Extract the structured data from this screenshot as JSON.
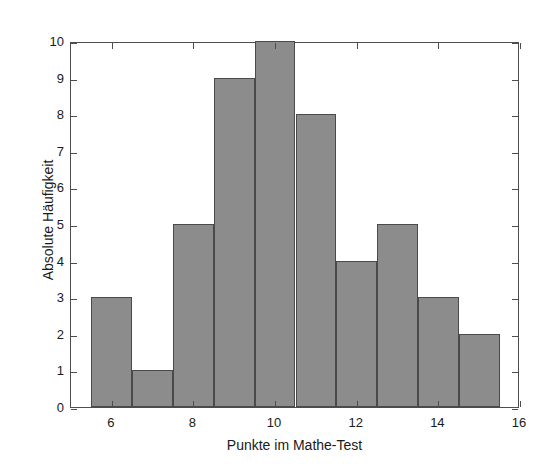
{
  "chart_data": {
    "type": "bar",
    "title": "",
    "subtitle": "",
    "xlabel": "Punkte im Mathe-Test",
    "ylabel": "Absolute Häufigkeit",
    "xlim": [
      5,
      16
    ],
    "ylim": [
      0,
      10
    ],
    "grid": false,
    "legend": null,
    "legend_position": "none",
    "bar_fill_color": "#8c8c8c",
    "bar_edge_color": "#4a4a4a",
    "axis_color": "#4d4d4d",
    "background_color": "#ffffff",
    "bin_width": 1,
    "categories": [
      6,
      7,
      8,
      9,
      10,
      11,
      12,
      13,
      14,
      15
    ],
    "bin_edges": [
      5.5,
      6.5,
      7.5,
      8.5,
      9.5,
      10.5,
      11.5,
      12.5,
      13.5,
      14.5,
      15.5
    ],
    "values": [
      3,
      1,
      5,
      9,
      10,
      8,
      4,
      5,
      3,
      2
    ],
    "bars": [
      {
        "center": 6,
        "left": 5.5,
        "right": 6.5,
        "value": 3
      },
      {
        "center": 7,
        "left": 6.5,
        "right": 7.5,
        "value": 1
      },
      {
        "center": 8,
        "left": 7.5,
        "right": 8.5,
        "value": 5
      },
      {
        "center": 9,
        "left": 8.5,
        "right": 9.5,
        "value": 9
      },
      {
        "center": 10,
        "left": 9.5,
        "right": 10.5,
        "value": 10
      },
      {
        "center": 11,
        "left": 10.5,
        "right": 11.5,
        "value": 8
      },
      {
        "center": 12,
        "left": 11.5,
        "right": 12.5,
        "value": 4
      },
      {
        "center": 13,
        "left": 12.5,
        "right": 13.5,
        "value": 5
      },
      {
        "center": 14,
        "left": 13.5,
        "right": 14.5,
        "value": 3
      },
      {
        "center": 15,
        "left": 14.5,
        "right": 15.5,
        "value": 2
      }
    ],
    "xticks": [
      6,
      8,
      10,
      12,
      14,
      16
    ],
    "xtick_labels": [
      "6",
      "8",
      "10",
      "12",
      "14",
      "16"
    ],
    "yticks": [
      0,
      1,
      2,
      3,
      4,
      5,
      6,
      7,
      8,
      9,
      10
    ],
    "ytick_labels": [
      "0",
      "1",
      "2",
      "3",
      "4",
      "5",
      "6",
      "7",
      "8",
      "9",
      "10"
    ]
  }
}
